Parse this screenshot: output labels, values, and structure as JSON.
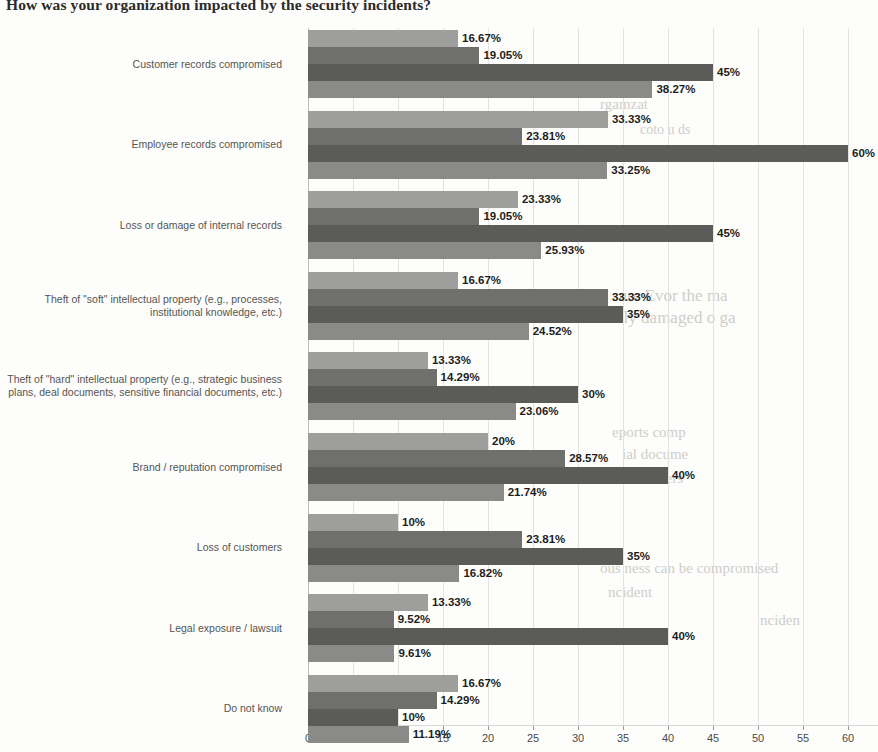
{
  "chart_data": {
    "type": "bar",
    "orientation": "horizontal",
    "title": "How was your organization impacted by the security incidents?",
    "xlabel": "",
    "ylabel": "",
    "xlim": [
      0,
      65
    ],
    "xticks": [
      0,
      5,
      10,
      15,
      20,
      25,
      30,
      35,
      40,
      45,
      50,
      55,
      60,
      65
    ],
    "xtick_labels": [
      "0",
      "5",
      "10",
      "15",
      "20",
      "25",
      "30",
      "35",
      "40",
      "45",
      "50",
      "55",
      "60",
      "6"
    ],
    "grid": true,
    "legend": "none",
    "categories": [
      "Customer records compromised",
      "Employee records compromised",
      "Loss or damage of internal records",
      "Theft of \"soft\" intellectual property (e.g., processes, institutional knowledge, etc.)",
      "Theft of \"hard\" intellectual property (e.g., strategic business plans, deal documents, sensitive financial documents, etc.)",
      "Brand / reputation compromised",
      "Loss of customers",
      "Legal exposure / lawsuit",
      "Do not know"
    ],
    "category_lines": [
      [
        "Customer records compromised"
      ],
      [
        "Employee records compromised"
      ],
      [
        "Loss or damage of internal records"
      ],
      [
        "Theft of \"soft\" intellectual property (e.g., processes,",
        "institutional knowledge, etc.)"
      ],
      [
        "Theft of \"hard\" intellectual property (e.g., strategic business",
        "plans, deal documents, sensitive financial documents, etc.)"
      ],
      [
        "Brand / reputation compromised"
      ],
      [
        "Loss of customers"
      ],
      [
        "Legal exposure / lawsuit"
      ],
      [
        "Do not know"
      ]
    ],
    "series": [
      {
        "name": "series-1",
        "color": "#9e9e9c",
        "values": [
          16.67,
          33.33,
          23.33,
          16.67,
          13.33,
          20,
          10,
          13.33,
          16.67
        ],
        "labels": [
          "16.67%",
          "33.33%",
          "23.33%",
          "16.67%",
          "13.33%",
          "20%",
          "10%",
          "13.33%",
          "16.67%"
        ]
      },
      {
        "name": "series-2",
        "color": "#6f6f6e",
        "values": [
          19.05,
          23.81,
          19.05,
          33.33,
          14.29,
          28.57,
          23.81,
          9.52,
          14.29
        ],
        "labels": [
          "19.05%",
          "23.81%",
          "19.05%",
          "33.33%",
          "14.29%",
          "28.57%",
          "23.81%",
          "9.52%",
          "14.29%"
        ]
      },
      {
        "name": "series-3",
        "color": "#5b5b5a",
        "values": [
          45,
          60,
          45,
          35,
          30,
          40,
          35,
          40,
          10
        ],
        "labels": [
          "45%",
          "60%",
          "45%",
          "35%",
          "30%",
          "40%",
          "35%",
          "40%",
          "10%"
        ]
      },
      {
        "name": "series-4",
        "color": "#8a8a88",
        "values": [
          38.27,
          33.25,
          25.93,
          24.52,
          23.06,
          21.74,
          16.82,
          9.61,
          11.19
        ],
        "labels": [
          "38.27%",
          "33.25%",
          "25.93%",
          "24.52%",
          "23.06%",
          "21.74%",
          "16.82%",
          "9.61%",
          "11.19%"
        ]
      }
    ]
  },
  "background_text": [
    {
      "text": "rgamzat",
      "x": 600,
      "y": 96,
      "size": 15
    },
    {
      "text": "coto  u  ds",
      "x": 640,
      "y": 122,
      "size": 14
    },
    {
      "text": "sure  Evor  the  ma",
      "x": 612,
      "y": 286,
      "size": 17
    },
    {
      "text": "ously  damaged  o  ga",
      "x": 600,
      "y": 308,
      "size": 17
    },
    {
      "text": "eports  comp",
      "x": 612,
      "y": 424,
      "size": 15
    },
    {
      "text": "ial  docume",
      "x": 622,
      "y": 446,
      "size": 15
    },
    {
      "text": "of  customers",
      "x": 606,
      "y": 470,
      "size": 15
    },
    {
      "text": "ous  ness  can  be  compromised",
      "x": 600,
      "y": 560,
      "size": 15
    },
    {
      "text": "ncident",
      "x": 608,
      "y": 584,
      "size": 15
    },
    {
      "text": "nciden",
      "x": 760,
      "y": 612,
      "size": 15
    }
  ]
}
